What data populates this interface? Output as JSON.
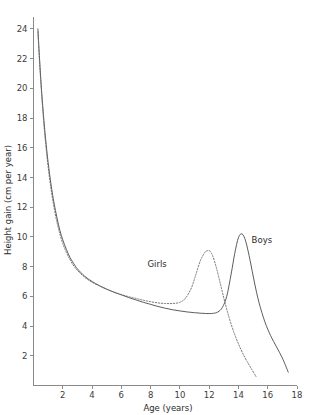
{
  "chart_data": {
    "type": "line",
    "title": "",
    "xlabel": "Age (years)",
    "ylabel": "Height gain (cm per year)",
    "xlim": [
      0,
      18
    ],
    "ylim": [
      0,
      24.8
    ],
    "xticks": [
      2,
      4,
      6,
      8,
      10,
      12,
      14,
      16,
      18
    ],
    "yticks": [
      2,
      4,
      6,
      8,
      10,
      12,
      14,
      16,
      18,
      20,
      22,
      24
    ],
    "xtick_labels": [
      "2",
      "4",
      "6",
      "8",
      "10",
      "12",
      "14",
      "16",
      "18"
    ],
    "ytick_labels": [
      "2",
      "4",
      "6",
      "8",
      "10",
      "12",
      "14",
      "16",
      "18",
      "20",
      "22",
      "24"
    ],
    "grid": false,
    "legend_position": "inline-annotations",
    "series": [
      {
        "name": "Boys",
        "style": "solid",
        "color": "#4a4a4a",
        "label_x": 14.9,
        "label_y": 9.6,
        "x": [
          0.3,
          0.4,
          0.5,
          0.6,
          0.75,
          0.9,
          1.0,
          1.2,
          1.4,
          1.6,
          1.8,
          2.0,
          2.25,
          2.5,
          2.75,
          3.0,
          3.5,
          4.0,
          4.5,
          5.0,
          5.5,
          6.0,
          6.5,
          7.0,
          7.5,
          8.0,
          8.5,
          9.0,
          9.5,
          10.0,
          10.5,
          11.0,
          11.5,
          12.0,
          12.3,
          12.6,
          12.9,
          13.2,
          13.5,
          13.75,
          14.0,
          14.25,
          14.5,
          14.8,
          15.1,
          15.4,
          15.8,
          16.2,
          16.6,
          17.0,
          17.4
        ],
        "y": [
          24.0,
          22.2,
          20.6,
          19.2,
          17.4,
          15.9,
          15.0,
          13.5,
          12.3,
          11.3,
          10.45,
          9.8,
          9.15,
          8.6,
          8.2,
          7.85,
          7.35,
          7.0,
          6.72,
          6.48,
          6.28,
          6.1,
          5.92,
          5.76,
          5.6,
          5.46,
          5.32,
          5.2,
          5.1,
          5.02,
          4.95,
          4.9,
          4.86,
          4.84,
          4.86,
          4.95,
          5.25,
          6.0,
          7.5,
          8.9,
          9.95,
          10.2,
          9.7,
          8.4,
          6.9,
          5.6,
          4.3,
          3.35,
          2.6,
          1.85,
          0.9
        ]
      },
      {
        "name": "Girls",
        "style": "dotted",
        "color": "#6a6a6a",
        "label_x": 9.1,
        "label_y": 7.95,
        "x": [
          0.3,
          0.4,
          0.5,
          0.6,
          0.75,
          0.9,
          1.0,
          1.2,
          1.4,
          1.6,
          1.8,
          2.0,
          2.25,
          2.5,
          2.75,
          3.0,
          3.5,
          4.0,
          4.5,
          5.0,
          5.5,
          6.0,
          6.5,
          7.0,
          7.5,
          8.0,
          8.5,
          9.0,
          9.5,
          10.0,
          10.4,
          10.8,
          11.1,
          11.4,
          11.7,
          11.9,
          12.05,
          12.25,
          12.5,
          12.8,
          13.1,
          13.4,
          13.7,
          14.0,
          14.3,
          14.6,
          14.9,
          15.2
        ],
        "y": [
          23.8,
          22.0,
          20.4,
          19.0,
          17.1,
          15.6,
          14.7,
          13.2,
          12.0,
          11.0,
          10.2,
          9.55,
          8.95,
          8.45,
          8.05,
          7.75,
          7.28,
          6.95,
          6.7,
          6.48,
          6.28,
          6.12,
          5.98,
          5.86,
          5.74,
          5.64,
          5.56,
          5.52,
          5.52,
          5.6,
          5.9,
          6.6,
          7.5,
          8.4,
          8.95,
          9.08,
          9.05,
          8.7,
          7.9,
          6.7,
          5.5,
          4.45,
          3.55,
          2.8,
          2.15,
          1.6,
          1.1,
          0.6
        ]
      }
    ]
  }
}
